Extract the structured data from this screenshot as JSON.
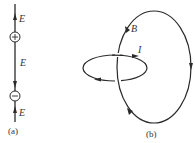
{
  "figure": {
    "panel_a": {
      "caption": "(a)",
      "top_field_label": "E",
      "middle_field_label": "E",
      "bottom_field_label": "E",
      "positive_charge_symbol": "+",
      "negative_charge_symbol": "−"
    },
    "panel_b": {
      "caption": "(b)",
      "magnetic_loop_label": "B",
      "current_loop_label": "I"
    },
    "colors": {
      "line": "#2a2a2a",
      "background": "#ffffff"
    }
  }
}
